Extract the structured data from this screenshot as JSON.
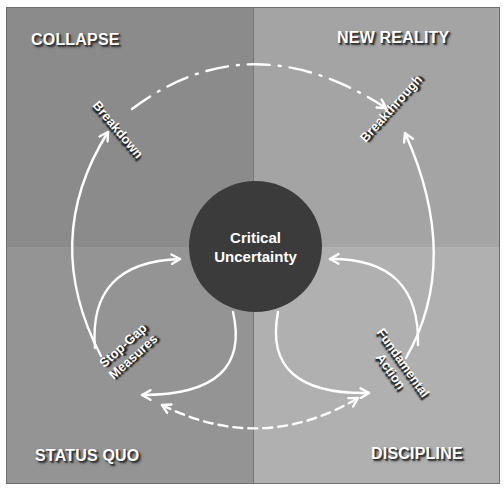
{
  "colors": {
    "quadrant_top_left": "#8b8b8b",
    "quadrant_top_right": "#a4a4a4",
    "quadrant_bottom_left": "#949494",
    "quadrant_bottom_right": "#b0b0b0",
    "core_circle": "#3b3b3b",
    "arrows": "#ffffff",
    "label_text": "#ffffff"
  },
  "quadrants": {
    "top_left": {
      "label": "COLLAPSE"
    },
    "top_right": {
      "label": "NEW REALITY"
    },
    "bottom_left": {
      "label": "STATUS QUO"
    },
    "bottom_right": {
      "label": "DISCIPLINE"
    }
  },
  "core": {
    "line1": "Critical",
    "line2": "Uncertainty"
  },
  "nodes": {
    "breakdown": {
      "label": "Breakdown"
    },
    "breakthrough": {
      "label": "Breakthrough"
    },
    "stop_gap": {
      "line1": "Stop-Gap",
      "line2": "Measures"
    },
    "fundamental": {
      "line1": "Fundamental",
      "line2": "Action"
    }
  },
  "connections": [
    {
      "from": "Breakdown",
      "to": "Breakthrough",
      "style": "dash-dot",
      "arrow": "end"
    },
    {
      "from": "Stop-Gap Measures",
      "to": "Breakdown",
      "style": "solid",
      "arrow": "end"
    },
    {
      "from": "Stop-Gap Measures",
      "to": "Critical Uncertainty",
      "style": "solid",
      "arrow": "end"
    },
    {
      "from": "Critical Uncertainty",
      "to": "Stop-Gap Measures",
      "style": "solid",
      "arrow": "end"
    },
    {
      "from": "Fundamental Action",
      "to": "Breakthrough",
      "style": "solid",
      "arrow": "end"
    },
    {
      "from": "Fundamental Action",
      "to": "Critical Uncertainty",
      "style": "solid",
      "arrow": "end"
    },
    {
      "from": "Critical Uncertainty",
      "to": "Fundamental Action",
      "style": "solid",
      "arrow": "end"
    },
    {
      "from": "Stop-Gap Measures",
      "to": "Fundamental Action",
      "style": "dashed",
      "arrow": "both"
    }
  ]
}
